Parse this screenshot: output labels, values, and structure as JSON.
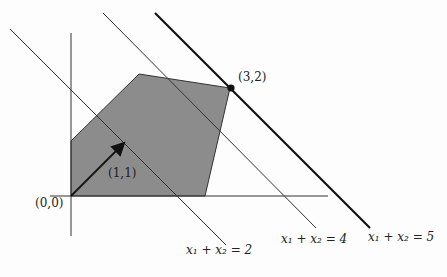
{
  "figure": {
    "colors": {
      "region_fill": "#8c8c8c",
      "lines": "#333333",
      "thick_line": "#111111"
    },
    "labels": {
      "origin": "(0,0)",
      "direction": "(1,1)",
      "optimum": "(3,2)",
      "line2": "x₁ + x₂ = 2",
      "line4": "x₁ + x₂ = 4",
      "line5": "x₁ + x₂ = 5"
    }
  }
}
